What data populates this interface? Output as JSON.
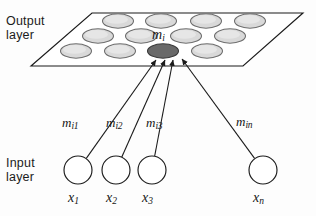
{
  "figure": {
    "background_color": "#fdfdfd",
    "line_color": "#1b1b1b",
    "node_fill": "#ffffff",
    "map_cell_fill": "#d9d9d9",
    "map_cell_stroke": "#6e6e6e",
    "winner_cell_fill": "#696969",
    "winner_cell_stroke": "#3a3a3a"
  },
  "labels": {
    "output_layer": "Output\nlayer",
    "input_layer": "Input\nlayer"
  },
  "output_map": {
    "winner_label_base": "m",
    "winner_label_sub": "i",
    "rows": [
      {
        "cells": [
          {
            "cx": 118,
            "cy": 21
          },
          {
            "cx": 161,
            "cy": 21
          },
          {
            "cx": 206,
            "cy": 21
          },
          {
            "cx": 250,
            "cy": 21
          }
        ]
      },
      {
        "cells": [
          {
            "cx": 98,
            "cy": 36
          },
          {
            "cx": 141,
            "cy": 36
          },
          {
            "cx": 186,
            "cy": 36
          },
          {
            "cx": 230,
            "cy": 36
          }
        ]
      },
      {
        "cells": [
          {
            "cx": 76,
            "cy": 51
          },
          {
            "cx": 120,
            "cy": 51
          },
          {
            "cx": 163,
            "cy": 51,
            "winner": true
          },
          {
            "cx": 207,
            "cy": 51
          }
        ]
      }
    ]
  },
  "weights": [
    {
      "base": "m",
      "sub": "i1",
      "x": 62,
      "y": 115
    },
    {
      "base": "m",
      "sub": "i2",
      "x": 106,
      "y": 115
    },
    {
      "base": "m",
      "sub": "i3",
      "x": 146,
      "y": 115
    },
    {
      "base": "m",
      "sub": "in",
      "x": 236,
      "y": 114
    }
  ],
  "input_nodes": [
    {
      "cx": 78,
      "cy": 170,
      "r": 14,
      "label_base": "x",
      "label_sub": "1",
      "label_x": 68,
      "label_y": 190
    },
    {
      "cx": 116,
      "cy": 170,
      "r": 14,
      "label_base": "x",
      "label_sub": "2",
      "label_x": 106,
      "label_y": 190
    },
    {
      "cx": 152,
      "cy": 170,
      "r": 14,
      "label_base": "x",
      "label_sub": "3",
      "label_x": 142,
      "label_y": 190
    },
    {
      "cx": 263,
      "cy": 170,
      "r": 14,
      "label_base": "x",
      "label_sub": "n",
      "label_x": 253,
      "label_y": 190
    }
  ],
  "connections": [
    {
      "from_node": 0,
      "to_x": 156,
      "to_y": 60
    },
    {
      "from_node": 1,
      "to_x": 165,
      "to_y": 60
    },
    {
      "from_node": 2,
      "to_x": 173,
      "to_y": 60
    },
    {
      "from_node": 3,
      "to_x": 182,
      "to_y": 59
    }
  ]
}
